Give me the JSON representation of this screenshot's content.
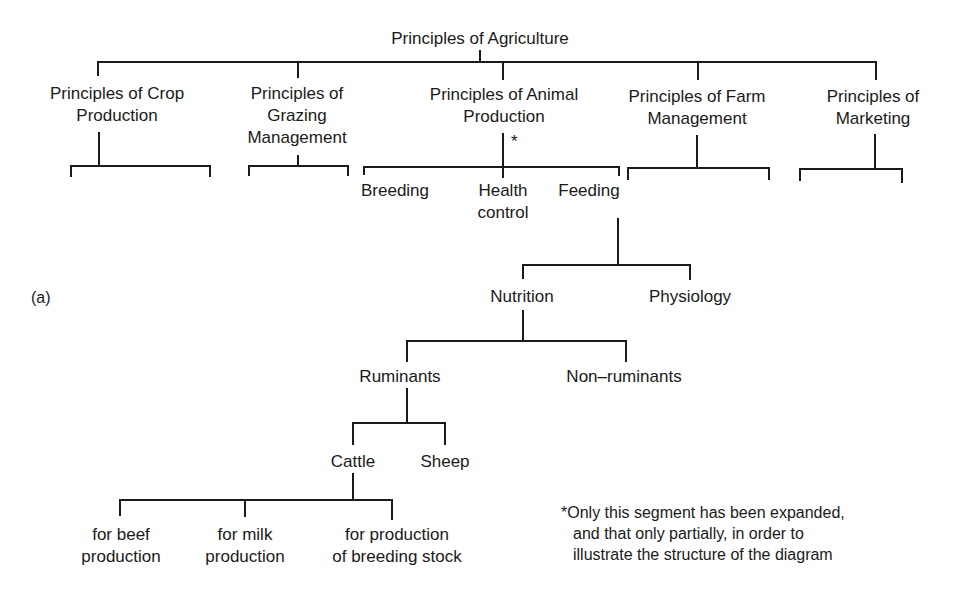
{
  "figure_label": "(a)",
  "root": {
    "label": "Principles of Agriculture"
  },
  "level1": [
    {
      "line1": "Principles of Crop",
      "line2": "Production",
      "line3": ""
    },
    {
      "line1": "Principles of",
      "line2": "Grazing",
      "line3": "Management"
    },
    {
      "line1": "Principles of Animal",
      "line2": "Production",
      "line3": ""
    },
    {
      "line1": "Principles of Farm",
      "line2": "Management",
      "line3": ""
    },
    {
      "line1": "Principles of",
      "line2": "Marketing",
      "line3": ""
    }
  ],
  "animal_production_marker": "*",
  "animal_children": [
    {
      "line1": "Breeding",
      "line2": ""
    },
    {
      "line1": "Health",
      "line2": "control"
    },
    {
      "line1": "Feeding",
      "line2": ""
    }
  ],
  "feeding_children": [
    {
      "label": "Nutrition"
    },
    {
      "label": "Physiology"
    }
  ],
  "nutrition_children": [
    {
      "label": "Ruminants"
    },
    {
      "label": "Non–ruminants"
    }
  ],
  "ruminant_children": [
    {
      "label": "Cattle"
    },
    {
      "label": "Sheep"
    }
  ],
  "cattle_children": [
    {
      "line1": "for beef",
      "line2": "production"
    },
    {
      "line1": "for milk",
      "line2": "production"
    },
    {
      "line1": "for production",
      "line2": "of breeding stock"
    }
  ],
  "footnote": {
    "line1": "*Only this segment has been expanded,",
    "line2": "and that only partially, in order to",
    "line3": "illustrate the structure of the diagram"
  }
}
